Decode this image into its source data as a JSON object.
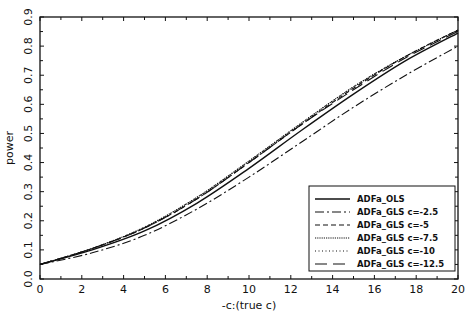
{
  "chart_data": {
    "type": "line",
    "title": "",
    "xlabel": "-c:(true c)",
    "ylabel": "power",
    "xlim": [
      0,
      20
    ],
    "ylim": [
      0.0,
      0.9
    ],
    "xticks": [
      0,
      2,
      4,
      6,
      8,
      10,
      12,
      14,
      16,
      18,
      20
    ],
    "yticks": [
      "0.0",
      "0.1",
      "0.2",
      "0.3",
      "0.4",
      "0.5",
      "0.6",
      "0.7",
      "0.8",
      "0.9"
    ],
    "grid": false,
    "legend_position": "lower right",
    "x": [
      0,
      2.5,
      5,
      7.5,
      10,
      12.5,
      15,
      17.5,
      20
    ],
    "series": [
      {
        "name": "ADFa_OLS",
        "style": "solid",
        "values": [
          0.05,
          0.1,
          0.165,
          0.26,
          0.38,
          0.51,
          0.635,
          0.75,
          0.845
        ]
      },
      {
        "name": "ADFa_GLS c=-2.5",
        "style": "dashdot",
        "values": [
          0.05,
          0.09,
          0.15,
          0.24,
          0.35,
          0.47,
          0.59,
          0.7,
          0.8
        ]
      },
      {
        "name": "ADFa_GLS c=-5",
        "style": "dashed",
        "values": [
          0.05,
          0.105,
          0.175,
          0.275,
          0.4,
          0.53,
          0.655,
          0.765,
          0.855
        ]
      },
      {
        "name": "ADFa_GLS c=-7.5",
        "style": "dense-dotted",
        "values": [
          0.05,
          0.105,
          0.178,
          0.28,
          0.405,
          0.535,
          0.66,
          0.765,
          0.855
        ]
      },
      {
        "name": "ADFa_GLS c=-10",
        "style": "dotted",
        "values": [
          0.05,
          0.105,
          0.178,
          0.28,
          0.405,
          0.535,
          0.66,
          0.765,
          0.855
        ]
      },
      {
        "name": "ADFa_GLS c=-12.5",
        "style": "long-dash",
        "values": [
          0.05,
          0.105,
          0.175,
          0.275,
          0.4,
          0.53,
          0.65,
          0.76,
          0.85
        ]
      }
    ]
  }
}
